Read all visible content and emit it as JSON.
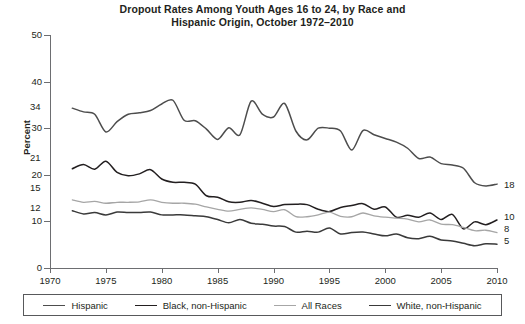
{
  "title": {
    "line1": "Dropout Rates Among Youth Ages 16 to 24, by Race and",
    "line2": "Hispanic Origin, October 1972–2010"
  },
  "axes": {
    "y_title": "Percent",
    "y_ticks": [
      "0",
      "10",
      "20",
      "30",
      "40",
      "50"
    ],
    "x_ticks": [
      "1970",
      "1975",
      "1980",
      "1985",
      "1990",
      "1995",
      "2000",
      "2005",
      "2010"
    ]
  },
  "start_labels": {
    "hispanic": "34",
    "black": "21",
    "all_races": "15",
    "white": "12"
  },
  "end_labels": {
    "hispanic": "18",
    "black": "10",
    "all_races": "8",
    "white": "5"
  },
  "legend": {
    "items": [
      {
        "label": "Hispanic",
        "color": "#4d4d4d"
      },
      {
        "label": "Black, non-Hispanic",
        "color": "#231f20"
      },
      {
        "label": "All Races",
        "color": "#a6a6a6"
      },
      {
        "label": "White, non-Hispanic",
        "color": "#3a3a3a"
      }
    ]
  },
  "chart_data": {
    "type": "line",
    "title": "Dropout Rates Among Youth Ages 16 to 24, by Race and Hispanic Origin, October 1972–2010",
    "xlabel": "",
    "ylabel": "Percent",
    "xlim": [
      1970,
      2010
    ],
    "ylim": [
      0,
      50
    ],
    "grid": false,
    "legend_position": "bottom",
    "x": [
      1972,
      1973,
      1974,
      1975,
      1976,
      1977,
      1978,
      1979,
      1980,
      1981,
      1982,
      1983,
      1984,
      1985,
      1986,
      1987,
      1988,
      1989,
      1990,
      1991,
      1992,
      1993,
      1994,
      1995,
      1996,
      1997,
      1998,
      1999,
      2000,
      2001,
      2002,
      2003,
      2004,
      2005,
      2006,
      2007,
      2008,
      2009,
      2010
    ],
    "series": [
      {
        "name": "Hispanic",
        "color": "#4d4d4d",
        "values": [
          34.3,
          33.5,
          33.0,
          29.2,
          31.4,
          33.0,
          33.3,
          33.8,
          35.2,
          36.0,
          31.7,
          31.6,
          29.8,
          27.6,
          30.1,
          28.6,
          35.8,
          33.0,
          32.4,
          35.3,
          29.4,
          27.5,
          30.0,
          30.0,
          29.4,
          25.3,
          29.5,
          28.6,
          27.8,
          27.0,
          25.7,
          23.5,
          23.8,
          22.4,
          22.1,
          21.4,
          18.3,
          17.6,
          18.0
        ]
      },
      {
        "name": "Black, non-Hispanic",
        "color": "#231f20",
        "values": [
          21.3,
          22.2,
          21.2,
          22.9,
          20.5,
          19.8,
          20.2,
          21.1,
          19.1,
          18.4,
          18.4,
          18.0,
          15.5,
          15.2,
          14.2,
          14.1,
          14.5,
          13.9,
          13.2,
          13.6,
          13.7,
          13.6,
          12.6,
          12.1,
          13.0,
          13.4,
          13.8,
          12.6,
          13.1,
          10.9,
          11.3,
          10.9,
          11.8,
          10.4,
          11.5,
          8.4,
          9.9,
          9.3,
          10.3
        ]
      },
      {
        "name": "All Races",
        "color": "#a6a6a6",
        "values": [
          14.6,
          14.1,
          14.3,
          13.9,
          14.1,
          14.1,
          14.2,
          14.6,
          14.1,
          13.9,
          13.9,
          13.7,
          13.1,
          12.6,
          12.2,
          12.6,
          12.9,
          12.6,
          12.1,
          12.5,
          11.0,
          11.0,
          11.4,
          12.0,
          11.1,
          11.0,
          11.8,
          11.2,
          10.9,
          10.7,
          10.5,
          9.9,
          10.3,
          9.4,
          9.3,
          8.7,
          8.0,
          8.1,
          7.6
        ]
      },
      {
        "name": "White, non-Hispanic",
        "color": "#3a3a3a",
        "values": [
          12.3,
          11.6,
          11.9,
          11.4,
          12.0,
          11.9,
          11.9,
          12.0,
          11.4,
          11.4,
          11.4,
          11.2,
          11.0,
          10.4,
          9.7,
          10.4,
          9.6,
          9.4,
          9.0,
          8.9,
          7.7,
          7.9,
          7.7,
          8.6,
          7.3,
          7.6,
          7.7,
          7.3,
          6.9,
          7.3,
          6.5,
          6.3,
          6.8,
          6.0,
          5.8,
          5.3,
          4.8,
          5.2,
          5.1
        ]
      }
    ]
  }
}
